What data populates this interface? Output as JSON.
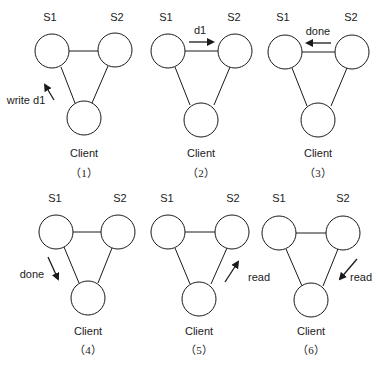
{
  "diagram": {
    "colors": {
      "stroke": "#1a1a1a",
      "background": "#ffffff"
    },
    "node_labels": {
      "s1": "S1",
      "s2": "S2",
      "client": "Client"
    },
    "panels": [
      {
        "caption": "（1）",
        "arrow_label": "write d1",
        "arrow": "client-to-s1"
      },
      {
        "caption": "（2）",
        "arrow_label": "d1",
        "arrow": "s1-to-s2"
      },
      {
        "caption": "（3）",
        "arrow_label": "done",
        "arrow": "s2-to-s1"
      },
      {
        "caption": "（4）",
        "arrow_label": "done",
        "arrow": "s1-to-client"
      },
      {
        "caption": "（5）",
        "arrow_label": "read",
        "arrow": "client-to-s2"
      },
      {
        "caption": "（6）",
        "arrow_label": "read",
        "arrow": "s2-to-client"
      }
    ]
  }
}
